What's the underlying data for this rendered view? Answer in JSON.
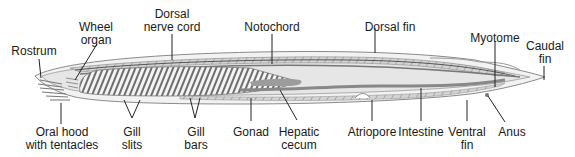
{
  "diagram": {
    "colors": {
      "outline": "#7a7a7a",
      "body_fill": "#ececec",
      "band_fill": "#cfcfcf",
      "gill_stripe": "#6e6e6e",
      "leader": "#222222",
      "text": "#1a1a1a"
    },
    "labels": {
      "rostrum": {
        "line1": "Rostrum",
        "line2": ""
      },
      "wheel_organ": {
        "line1": "Wheel",
        "line2": "organ"
      },
      "dorsal_nerve_cord": {
        "line1": "Dorsal",
        "line2": "nerve cord"
      },
      "notochord": {
        "line1": "Notochord",
        "line2": ""
      },
      "dorsal_fin": {
        "line1": "Dorsal fin",
        "line2": ""
      },
      "myotome": {
        "line1": "Myotome",
        "line2": ""
      },
      "caudal_fin": {
        "line1": "Caudal",
        "line2": "fin"
      },
      "oral_hood": {
        "line1": "Oral hood",
        "line2": "with tentacles"
      },
      "gill_slits": {
        "line1": "Gill",
        "line2": "slits"
      },
      "gill_bars": {
        "line1": "Gill",
        "line2": "bars"
      },
      "gonad": {
        "line1": "Gonad",
        "line2": ""
      },
      "hepatic_cecum": {
        "line1": "Hepatic",
        "line2": "cecum"
      },
      "atriopore": {
        "line1": "Atriopore",
        "line2": ""
      },
      "intestine": {
        "line1": "Intestine",
        "line2": ""
      },
      "ventral_fin": {
        "line1": "Ventral",
        "line2": "fin"
      },
      "anus": {
        "line1": "Anus",
        "line2": ""
      }
    }
  }
}
